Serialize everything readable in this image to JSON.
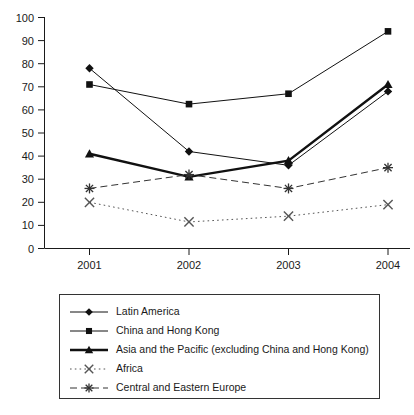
{
  "chart_data": {
    "type": "line",
    "title": "",
    "subtitle": "",
    "xlabel": "",
    "ylabel": "",
    "categories": [
      "2001",
      "2002",
      "2003",
      "2004"
    ],
    "x_tick_labels": [
      "2001",
      "2002",
      "2003",
      "2004"
    ],
    "y_tick_labels": [
      "0",
      "10",
      "20",
      "30",
      "40",
      "50",
      "60",
      "70",
      "80",
      "90",
      "100"
    ],
    "y_ticks": [
      0,
      10,
      20,
      30,
      40,
      50,
      60,
      70,
      80,
      90,
      100
    ],
    "ylim": [
      0,
      100
    ],
    "grid": false,
    "legend_position": "bottom",
    "series": [
      {
        "name": "Latin America",
        "values": [
          78,
          42,
          36,
          68
        ],
        "marker": "diamond",
        "line_style": "solid",
        "line_width": 1,
        "color": "#111111"
      },
      {
        "name": "China and Hong Kong",
        "values": [
          71,
          62.5,
          67,
          94
        ],
        "marker": "square",
        "line_style": "solid",
        "line_width": 1,
        "color": "#111111"
      },
      {
        "name": "Asia and the Pacific (excluding China and Hong Kong)",
        "values": [
          41,
          31,
          38,
          71
        ],
        "marker": "triangle",
        "line_style": "solid",
        "line_width": 2.4,
        "color": "#111111"
      },
      {
        "name": "Africa",
        "values": [
          20,
          11.5,
          14,
          19
        ],
        "marker": "cross-x",
        "line_style": "dotted",
        "line_width": 1,
        "color": "#555555"
      },
      {
        "name": "Central and Eastern Europe",
        "values": [
          26,
          32,
          26,
          35
        ],
        "marker": "asterisk",
        "line_style": "dashed",
        "line_width": 1,
        "color": "#333333"
      }
    ]
  },
  "legend": {
    "entries": [
      {
        "label": "Latin America",
        "marker": "diamond-icon"
      },
      {
        "label": "China and Hong Kong",
        "marker": "square-icon"
      },
      {
        "label": "Asia and the Pacific (excluding China and Hong Kong)",
        "marker": "triangle-icon"
      },
      {
        "label": "Africa",
        "marker": "cross-x-icon"
      },
      {
        "label": "Central and Eastern Europe",
        "marker": "asterisk-icon"
      }
    ]
  },
  "colors": {
    "axis": "#1a1a1a",
    "series_primary": "#111111",
    "series_muted": "#555555",
    "legend_border": "#333333",
    "background": "#ffffff"
  }
}
